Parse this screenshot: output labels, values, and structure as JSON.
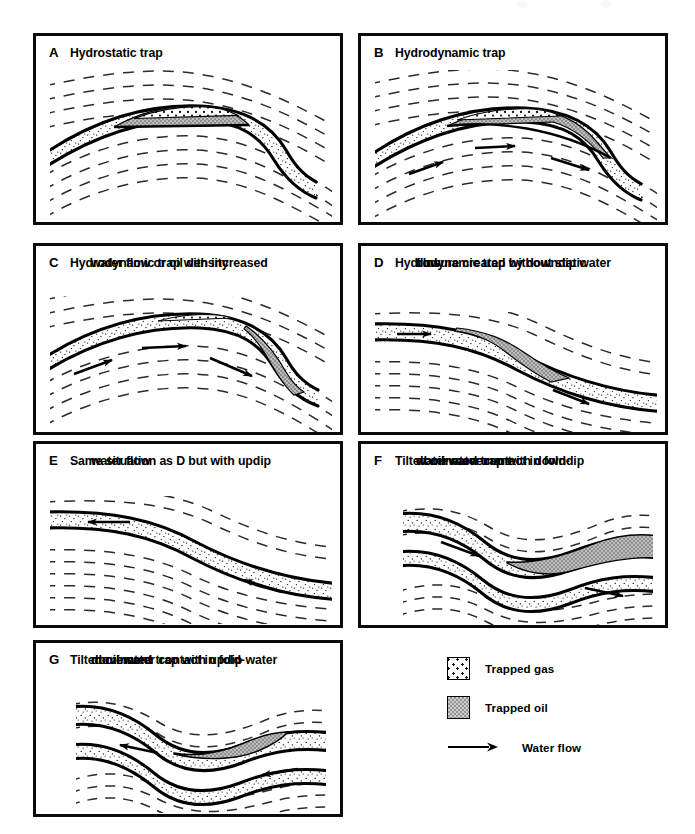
{
  "figure": {
    "panel_count": 7,
    "colors": {
      "ink": "#0a0a0a",
      "oil_fill": "#a8a8a8",
      "gas_fill": "#ffffff",
      "reservoir_fill": "#ffffff",
      "background": "#ffffff"
    }
  },
  "panels": [
    {
      "letter": "A",
      "caption": "Hydrostatic trap",
      "caption_lines": [
        "Hydrostatic trap"
      ],
      "structure": "anticline",
      "has_gas": true,
      "has_oil": true,
      "water_flow": "none",
      "arrows": 0
    },
    {
      "letter": "B",
      "caption": "Hydrodynamic trap",
      "caption_lines": [
        "Hydrodynamic trap"
      ],
      "structure": "anticline",
      "has_gas": true,
      "has_oil": true,
      "water_flow": "downdip-right",
      "arrows": 3
    },
    {
      "letter": "C",
      "caption": "Hydrodynamic trap with increased water flow or oil density",
      "caption_lines": [
        "Hydrodynamic trap with increased",
        "water flow or oil density"
      ],
      "structure": "anticline",
      "has_gas": true,
      "has_oil": true,
      "water_flow": "downdip-right",
      "arrows": 3
    },
    {
      "letter": "D",
      "caption": "Hydrodynamic trap without static closure created by downdip water flow",
      "caption_lines": [
        "Hydrodynamic trap without static",
        "closure created by downdip water",
        "flow"
      ],
      "structure": "monocline",
      "has_gas": false,
      "has_oil": true,
      "water_flow": "downdip-right",
      "arrows": 2
    },
    {
      "letter": "E",
      "caption": "Same situation as D but with updip water flow",
      "caption_lines": [
        "Same situation as D but with updip",
        "water flow"
      ],
      "structure": "monocline",
      "has_gas": false,
      "has_oil": false,
      "water_flow": "updip-left",
      "arrows": 2
    },
    {
      "letter": "F",
      "caption": "Tilted oil-water contact in fold-dominated trap with downdip water movement",
      "caption_lines": [
        "Tilted oil-water contact in fold-",
        "dominated trap with downdip",
        "water movement"
      ],
      "structure": "fold",
      "has_gas": false,
      "has_oil": true,
      "water_flow": "downdip-right",
      "arrows": 2
    },
    {
      "letter": "G",
      "caption": "Tilted oil-water contact in fold-dominated trap with updip water movement",
      "caption_lines": [
        "Tilted oil-water contact in fold-",
        "dominated trap with updip water",
        "movement"
      ],
      "structure": "fold",
      "has_gas": false,
      "has_oil": true,
      "water_flow": "updip-left",
      "arrows": 2
    }
  ],
  "legend": {
    "items": [
      {
        "label": "Trapped gas",
        "symbol": "gas-swatch"
      },
      {
        "label": "Trapped oil",
        "symbol": "oil-swatch"
      },
      {
        "label": "Water flow",
        "symbol": "arrow-symbol"
      }
    ]
  }
}
